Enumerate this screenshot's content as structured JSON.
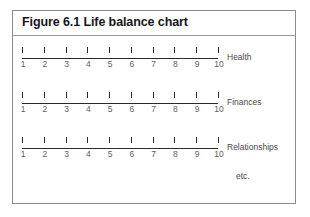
{
  "figure": {
    "title": "Figure 6.1 Life balance chart",
    "etc_label": "etc.",
    "border_color": "#8c8c8c",
    "line_color": "#2a2a2a",
    "text_color": "#4a4a4a"
  },
  "chart_data": {
    "type": "bar",
    "title": "Figure 6.1 Life balance chart",
    "xlabel": "",
    "ylabel": "",
    "xlim": [
      1,
      10
    ],
    "grid": false,
    "legend": "none",
    "annotations": [
      "etc."
    ],
    "categories": [
      "Health",
      "Finances",
      "Relationships"
    ],
    "tick_labels": [
      "1",
      "2",
      "3",
      "4",
      "5",
      "6",
      "7",
      "8",
      "9",
      "10"
    ],
    "values": [
      null,
      null,
      null
    ],
    "scales": [
      {
        "label": "Health",
        "ticks": [
          "1",
          "2",
          "3",
          "4",
          "5",
          "6",
          "7",
          "8",
          "9",
          "10"
        ],
        "rating": null
      },
      {
        "label": "Finances",
        "ticks": [
          "1",
          "2",
          "3",
          "4",
          "5",
          "6",
          "7",
          "8",
          "9",
          "10"
        ],
        "rating": null
      },
      {
        "label": "Relationships",
        "ticks": [
          "1",
          "2",
          "3",
          "4",
          "5",
          "6",
          "7",
          "8",
          "9",
          "10"
        ],
        "rating": null
      }
    ]
  }
}
